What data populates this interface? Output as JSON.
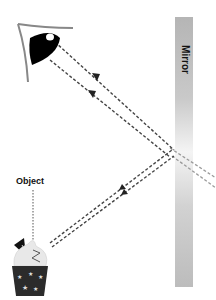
{
  "diagram": {
    "labels": {
      "mirror": "Mirror",
      "object": "Object"
    },
    "elements": {
      "eye": "eye-icon",
      "object": "cupcake-icon",
      "mirror": "plane-mirror"
    },
    "colors": {
      "mirror_dark": "#b8b8b8",
      "mirror_light": "#f2f2f2",
      "ray": "#444444",
      "ray_virtual": "#9a9a9a",
      "eye": "#000000",
      "cupcake_base": "#2a2a2a",
      "frosting": "#e6e6e6"
    },
    "rays": [
      {
        "from": "object",
        "to": "mirror",
        "type": "incident",
        "arrow": "toward-mirror"
      },
      {
        "from": "mirror",
        "to": "eye",
        "type": "reflected",
        "arrow": "toward-eye"
      },
      {
        "from": "mirror",
        "to": "behind-mirror",
        "type": "virtual-extension"
      }
    ]
  }
}
